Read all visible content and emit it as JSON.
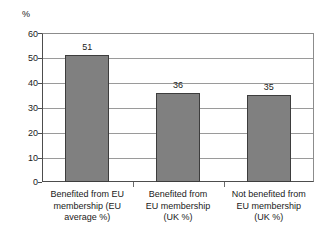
{
  "chart_data": {
    "type": "bar",
    "title": "",
    "subtitle": "",
    "xlabel": "",
    "ylabel": "%",
    "ylim": [
      0,
      60
    ],
    "ytick_step": 10,
    "yticks": [
      "60",
      "50",
      "40",
      "30",
      "20",
      "10",
      "0"
    ],
    "grid": true,
    "legend": "none",
    "categories": [
      "Benefited from EU membership (EU average %)",
      "Benefited from EU membership (UK %)",
      "Not benefited from EU membership (UK %)"
    ],
    "category_lines": [
      [
        "Benefited from EU",
        "membership (EU",
        "average %)"
      ],
      [
        "Benefited from",
        "EU membership",
        "(UK %)"
      ],
      [
        "Not benefited from",
        "EU membership",
        "(UK %)"
      ]
    ],
    "values": [
      51,
      36,
      35
    ],
    "value_labels": [
      "51",
      "36",
      "35"
    ],
    "bar_color": "#808080",
    "bar_border_color": "#3d3d3d",
    "gridline_color": "#9a9a9a",
    "axis_color": "#4d4d4d",
    "background_color": "#ffffff"
  }
}
